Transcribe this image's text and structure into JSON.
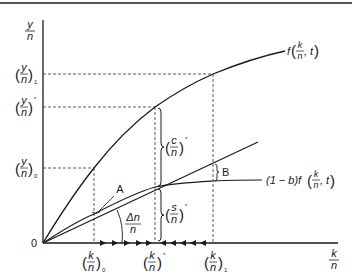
{
  "diagram": {
    "axes": {
      "y_label_num": "y",
      "y_label_den": "n",
      "x_label_num": "k",
      "x_label_den": "n",
      "origin": "0"
    },
    "y_ticks": [
      {
        "num": "y",
        "den": "n",
        "sub": "1",
        "y": 74
      },
      {
        "num": "y",
        "den": "n",
        "sub": "*",
        "y": 107
      },
      {
        "num": "y",
        "den": "n",
        "sub": "0",
        "y": 168
      }
    ],
    "x_ticks": [
      {
        "num": "k",
        "den": "n",
        "sub": "0",
        "x": 94
      },
      {
        "num": "k",
        "den": "n",
        "sub": "*",
        "x": 155
      },
      {
        "num": "k",
        "den": "n",
        "sub": "1",
        "x": 213
      }
    ],
    "curves": {
      "production": {
        "label": "f(k/n, t)",
        "label_prefix": "f",
        "label_suffix": ", t"
      },
      "savings": {
        "label": "(1 − b)f(k/n, t)",
        "label_prefix": "(1 − b)f",
        "label_suffix": ", t"
      },
      "dilution_line": {
        "label_num": "Δn",
        "label_den": "n"
      }
    },
    "annotations": {
      "A": "A",
      "B": "B",
      "consumption_num": "c",
      "consumption_den": "n",
      "consumption_sup": "*",
      "saving_num": "s",
      "saving_den": "n",
      "saving_sup": "*"
    }
  }
}
